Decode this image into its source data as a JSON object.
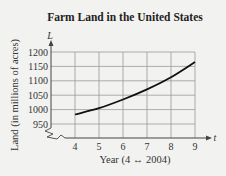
{
  "chart_data": {
    "type": "line",
    "title": "Farm Land in the United States",
    "xlabel": "Year (4 ↔ 2004)",
    "ylabel": "Land (in millions of acres)",
    "x_axis_var": "t",
    "y_axis_var": "L",
    "xlim": [
      3,
      9.6
    ],
    "ylim": [
      920,
      1200
    ],
    "x_ticks": [
      4,
      5,
      6,
      7,
      8,
      9
    ],
    "y_ticks": [
      950,
      1000,
      1050,
      1100,
      1150,
      1200
    ],
    "x_tick_labels": [
      "4",
      "5",
      "6",
      "7",
      "8",
      "9"
    ],
    "y_tick_labels": [
      "950",
      "1000",
      "1050",
      "1100",
      "1150",
      "1200"
    ],
    "grid": true,
    "axis_break": true,
    "series": [
      {
        "name": "L",
        "x": [
          4,
          5,
          6,
          7,
          8,
          9
        ],
        "y": [
          983,
          1005,
          1035,
          1070,
          1112,
          1165
        ]
      }
    ]
  }
}
